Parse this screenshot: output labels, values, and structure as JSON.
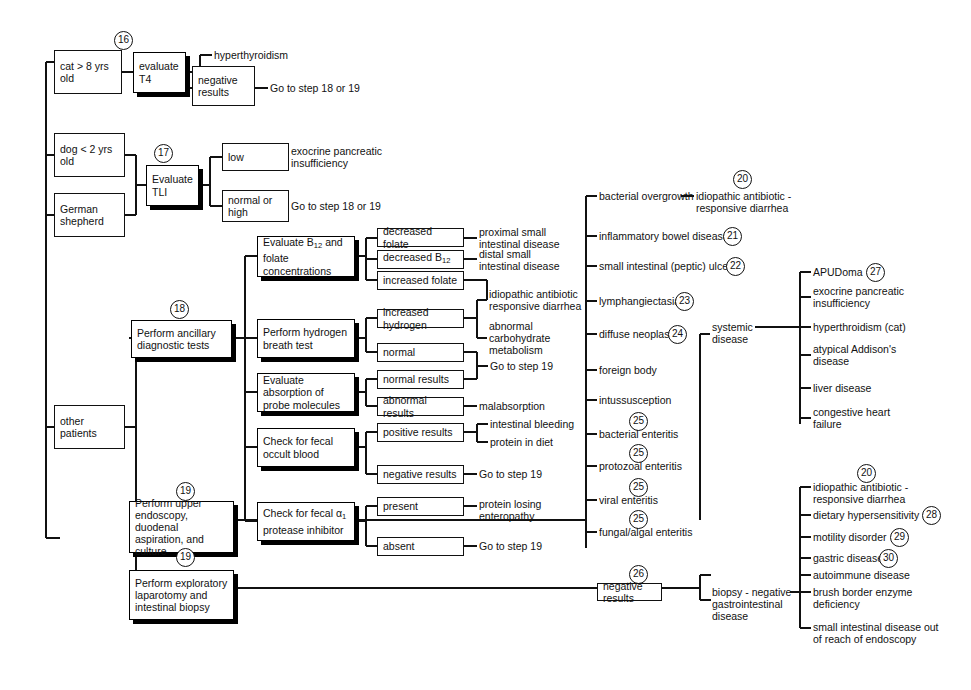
{
  "meta": {
    "ink": "#111111",
    "background": "#ffffff"
  },
  "signalment_boxes": [
    {
      "id": "cat",
      "label": "cat\n> 8 yrs old"
    },
    {
      "id": "dog",
      "label": "dog\n< 2 yrs old"
    },
    {
      "id": "gsd",
      "label": "German\nshepherd"
    },
    {
      "id": "other",
      "label": "other\npatients"
    }
  ],
  "step_boxes": [
    {
      "id": "t4",
      "step": "16",
      "label": "evaluate\nT4"
    },
    {
      "id": "tli",
      "step": "17",
      "label": "Evaluate\nTLI"
    },
    {
      "id": "ancillary",
      "step": "18",
      "label": "Perform ancillary\ndiagnostic tests"
    },
    {
      "id": "endoscopy",
      "step": "19",
      "label": "Perform upper\nendoscopy,\nduodenal aspiration,\nand culture"
    },
    {
      "id": "laparotomy",
      "step": "19",
      "label": "Perform exploratory\nlaparotomy and\nintestinal biopsy"
    }
  ],
  "test_boxes": [
    {
      "id": "b12",
      "label": "Evaluate B₁₂ and\nfolate concentrations"
    },
    {
      "id": "hydrogen",
      "label": "Perform hydrogen\nbreath test"
    },
    {
      "id": "probe",
      "label": "Evaluate absorption\nof probe molecules"
    },
    {
      "id": "occult",
      "label": "Check for fecal\noccult blood"
    },
    {
      "id": "protease",
      "label": "Check for fecal α₁\nprotease inhibitor"
    }
  ],
  "result_boxes": [
    {
      "id": "r-hyper-neg",
      "label": "negative\nresults"
    },
    {
      "id": "r-low",
      "label": "low"
    },
    {
      "id": "r-normhigh",
      "label": "normal or\nhigh"
    },
    {
      "id": "r-dec-folate",
      "label": "decreased folate"
    },
    {
      "id": "r-dec-b12",
      "label": "decreased B₁₂"
    },
    {
      "id": "r-inc-folate",
      "label": "increased folate"
    },
    {
      "id": "r-inc-hydrogen",
      "label": "increased hydrogen"
    },
    {
      "id": "r-normal",
      "label": "normal"
    },
    {
      "id": "r-normal-results",
      "label": "normal results"
    },
    {
      "id": "r-abnormal-results",
      "label": "abnormal results"
    },
    {
      "id": "r-positive-results",
      "label": "positive results"
    },
    {
      "id": "r-negative-results",
      "label": "negative results"
    },
    {
      "id": "r-present",
      "label": "present"
    },
    {
      "id": "r-absent",
      "label": "absent"
    },
    {
      "id": "r-neg-26",
      "label": "negative results",
      "step": "26"
    }
  ],
  "outcome_labels": [
    {
      "id": "o-hyperthyroidism",
      "text": "hyperthyroidism"
    },
    {
      "id": "o-goto-1819-a",
      "text": "Go to step 18 or 19"
    },
    {
      "id": "o-epi",
      "text": "exocrine pancreatic\ninsufficiency"
    },
    {
      "id": "o-goto-1819-b",
      "text": "Go to step 18 or 19"
    },
    {
      "id": "o-proximal",
      "text": "proximal small\nintestinal disease"
    },
    {
      "id": "o-distal",
      "text": "distal small\nintestinal disease"
    },
    {
      "id": "o-iard-a",
      "text": "idiopathic antibiotic\nresponsive diarrhea"
    },
    {
      "id": "o-carb",
      "text": "abnormal\ncarbohydrate\nmetabolism"
    },
    {
      "id": "o-goto-19-a",
      "text": "Go to step 19"
    },
    {
      "id": "o-malabsorption",
      "text": "malabsorption"
    },
    {
      "id": "o-bleeding",
      "text": "intestinal bleeding"
    },
    {
      "id": "o-protein-diet",
      "text": "protein in diet"
    },
    {
      "id": "o-goto-19-b",
      "text": "Go to step 19"
    },
    {
      "id": "o-ple",
      "text": "protein losing\nenteropathy"
    },
    {
      "id": "o-goto-19-c",
      "text": "Go to step 19"
    }
  ],
  "endoscopy_findings": [
    {
      "id": "f-overgrowth",
      "text": "bacterial overgrowth",
      "step": null
    },
    {
      "id": "f-ibd",
      "text": "inflammatory bowel disease",
      "step": "21"
    },
    {
      "id": "f-ulcer",
      "text": "small  intestinal  (peptic) ulcer",
      "step": "22"
    },
    {
      "id": "f-lymph",
      "text": "lymphangiectasia",
      "step": "23"
    },
    {
      "id": "f-neoplasia",
      "text": "diffuse neoplasia",
      "step": "24"
    },
    {
      "id": "f-foreign",
      "text": "foreign body",
      "step": null
    },
    {
      "id": "f-intuss",
      "text": "intussusception",
      "step": null
    },
    {
      "id": "f-bacterial-enteritis",
      "text": "bacterial enteritis",
      "step": "25"
    },
    {
      "id": "f-protozoal-enteritis",
      "text": "protozoal enteritis",
      "step": "25"
    },
    {
      "id": "f-viral-enteritis",
      "text": "viral enteritis",
      "step": "25"
    },
    {
      "id": "f-fungal-enteritis",
      "text": "fungal/algal enteritis",
      "step": "25"
    }
  ],
  "overgrowth_outcome": {
    "text": "idiopathic antibiotic -\nresponsive diarrhea",
    "step": "20"
  },
  "systemic_disease": {
    "label": "systemic\ndisease",
    "items": [
      {
        "id": "s-apudoma",
        "text": "APUDoma",
        "step": "27"
      },
      {
        "id": "s-epi",
        "text": "exocrine pancreatic\ninsufficiency",
        "step": null
      },
      {
        "id": "s-hyperthroid",
        "text": "hyperthroidism (cat)",
        "step": null
      },
      {
        "id": "s-addisons",
        "text": "atypical Addison's\ndisease",
        "step": null
      },
      {
        "id": "s-liver",
        "text": "liver disease",
        "step": null
      },
      {
        "id": "s-chf",
        "text": "congestive heart\nfailure",
        "step": null
      }
    ]
  },
  "biopsy_negative": {
    "label": "biopsy - negative\ngastrointestinal\ndisease",
    "items": [
      {
        "id": "b-iard",
        "text": "idiopathic antibiotic -\nresponsive diarrhea",
        "step": "20"
      },
      {
        "id": "b-dietary",
        "text": "dietary hypersensitivity",
        "step": "28"
      },
      {
        "id": "b-motility",
        "text": "motility disorder",
        "step": "29"
      },
      {
        "id": "b-gastric",
        "text": "gastric disease",
        "step": "30"
      },
      {
        "id": "b-autoimmune",
        "text": "autoimmune disease",
        "step": null
      },
      {
        "id": "b-brush",
        "text": "brush border enzyme\ndeficiency",
        "step": null
      },
      {
        "id": "b-out-of-reach",
        "text": "small intestinal disease out\nof reach of endoscopy",
        "step": null
      }
    ]
  }
}
